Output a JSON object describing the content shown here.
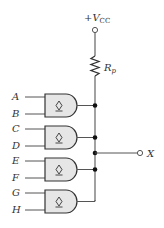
{
  "diagram": {
    "type": "wired-AND open-collector circuit",
    "supply": {
      "label_main": "+V",
      "label_sub": "CC"
    },
    "resistor": {
      "label_main": "R",
      "label_sub": "p"
    },
    "gates": [
      {
        "inputs": [
          "A",
          "B"
        ],
        "symbol": "open-collector"
      },
      {
        "inputs": [
          "C",
          "D"
        ],
        "symbol": "open-collector"
      },
      {
        "inputs": [
          "E",
          "F"
        ],
        "symbol": "open-collector"
      },
      {
        "inputs": [
          "G",
          "H"
        ],
        "symbol": "open-collector"
      }
    ],
    "output": {
      "label": "X"
    },
    "colors": {
      "line": "#555555",
      "gate_fill": "#e6e6e6",
      "dot": "#111111"
    }
  }
}
